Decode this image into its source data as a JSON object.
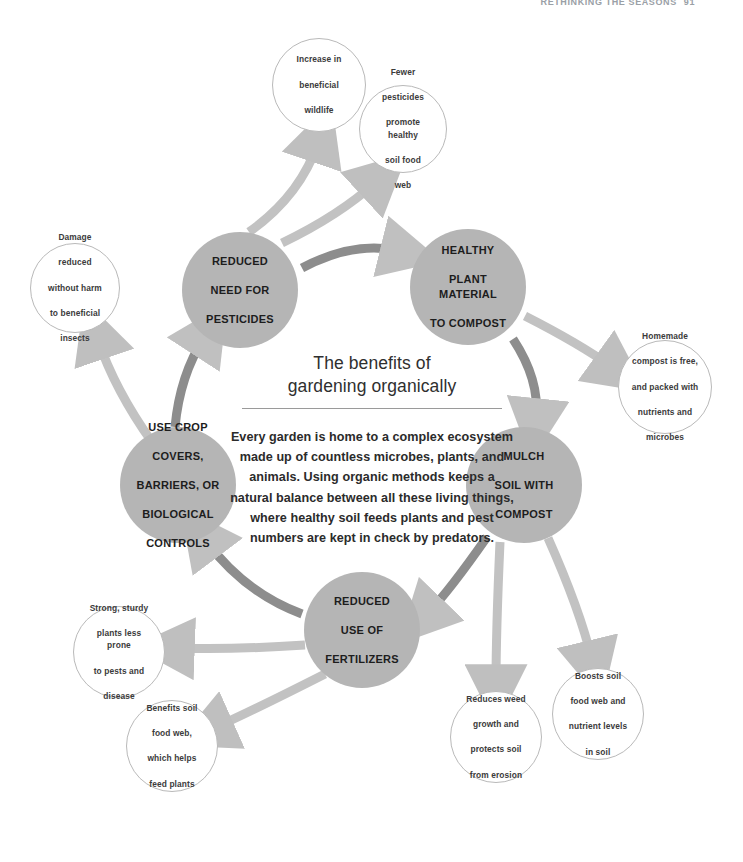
{
  "page_header": {
    "title": "Rethinking the seasons",
    "page_number": "91"
  },
  "center": {
    "title_line1": "The benefits of",
    "title_line2": "gardening organically",
    "body": "Every garden is home to a complex ecosystem made up of countless microbes, plants, and animals. Using organic methods keeps a natural balance between all these living things, where healthy soil feeds plants and pest numbers are kept in check by predators."
  },
  "colors": {
    "hub_fill": "#b5b5b5",
    "satellite_fill": "#ffffff",
    "satellite_stroke": "#b9b9b9",
    "cycle_arrow": "#8d8d8d",
    "spoke_arrow": "#c2c2c2",
    "text_dark": "#1d1d1d",
    "page_header": "#9aa0a6"
  },
  "hubs": [
    {
      "id": "reduced-need-for-pesticides",
      "label": "REDUCED NEED FOR PESTICIDES",
      "lines": [
        "REDUCED",
        "NEED FOR",
        "PESTICIDES"
      ],
      "cx": 240,
      "cy": 290,
      "r": 58
    },
    {
      "id": "healthy-plant-material-to-compost",
      "label": "HEALTHY PLANT MATERIAL TO COMPOST",
      "lines": [
        "HEALTHY",
        "PLANT MATERIAL",
        "TO COMPOST"
      ],
      "cx": 468,
      "cy": 287,
      "r": 58
    },
    {
      "id": "mulch-soil-with-compost",
      "label": "MULCH SOIL WITH COMPOST",
      "lines": [
        "MULCH",
        "SOIL WITH",
        "COMPOST"
      ],
      "cx": 524,
      "cy": 485,
      "r": 58
    },
    {
      "id": "reduced-use-of-fertilizers",
      "label": "REDUCED USE OF FERTILIZERS",
      "lines": [
        "REDUCED",
        "USE OF",
        "FERTILIZERS"
      ],
      "cx": 362,
      "cy": 630,
      "r": 58
    },
    {
      "id": "use-crop-covers-barriers-or-biological-controls",
      "label": "USE CROP COVERS, BARRIERS, OR BIOLOGICAL CONTROLS",
      "lines": [
        "USE CROP",
        "COVERS,",
        "BARRIERS, OR",
        "BIOLOGICAL",
        "CONTROLS"
      ],
      "cx": 178,
      "cy": 485,
      "r": 58
    }
  ],
  "satellites": [
    {
      "id": "increase-in-beneficial-wildlife",
      "label": "Increase in beneficial wildlife",
      "lines": [
        "Increase in",
        "beneficial",
        "wildlife"
      ],
      "cx": 319,
      "cy": 85,
      "r": 47,
      "from_hub": "reduced-need-for-pesticides"
    },
    {
      "id": "fewer-pesticides-promote-healthy-soil-food-web",
      "label": "Fewer pesticides promote healthy soil food web",
      "lines": [
        "Fewer",
        "pesticides",
        "promote healthy",
        "soil food",
        "web"
      ],
      "cx": 403,
      "cy": 129,
      "r": 44,
      "from_hub": "reduced-need-for-pesticides"
    },
    {
      "id": "damage-reduced-without-harm-to-beneficial-insects",
      "label": "Damage reduced without harm to beneficial insects",
      "lines": [
        "Damage",
        "reduced",
        "without harm",
        "to beneficial",
        "insects"
      ],
      "cx": 75,
      "cy": 288,
      "r": 45,
      "from_hub": "use-crop-covers-barriers-or-biological-controls"
    },
    {
      "id": "homemade-compost-is-free",
      "label": "Homemade compost is free, and packed with nutrients and microbes",
      "lines": [
        "Homemade",
        "compost is free,",
        "and packed with",
        "nutrients and",
        "microbes"
      ],
      "cx": 665,
      "cy": 387,
      "r": 47,
      "from_hub": "healthy-plant-material-to-compost"
    },
    {
      "id": "boosts-soil-food-web-and-nutrient-levels-in-soil",
      "label": "Boosts soil food web and nutrient levels in soil",
      "lines": [
        "Boosts soil",
        "food web and",
        "nutrient levels",
        "in soil"
      ],
      "cx": 598,
      "cy": 714,
      "r": 46,
      "from_hub": "mulch-soil-with-compost"
    },
    {
      "id": "reduces-weed-growth-and-protects-soil-from-erosion",
      "label": "Reduces weed growth and protects soil from erosion",
      "lines": [
        "Reduces weed",
        "growth and",
        "protects soil",
        "from erosion"
      ],
      "cx": 496,
      "cy": 737,
      "r": 46,
      "from_hub": "mulch-soil-with-compost"
    },
    {
      "id": "benefits-soil-food-web-which-helps-feed-plants",
      "label": "Benefits soil food web, which helps feed plants",
      "lines": [
        "Benefits soil",
        "food web,",
        "which helps",
        "feed plants"
      ],
      "cx": 172,
      "cy": 746,
      "r": 46,
      "from_hub": "reduced-use-of-fertilizers"
    },
    {
      "id": "strong-sturdy-plants-less-prone-to-pests-and-disease",
      "label": "Strong, sturdy plants less prone to pests and disease",
      "lines": [
        "Strong, sturdy",
        "plants less prone",
        "to pests and",
        "disease"
      ],
      "cx": 119,
      "cy": 652,
      "r": 46,
      "from_hub": "reduced-use-of-fertilizers"
    }
  ],
  "cycle_arrows": [
    {
      "id": "arrow-pesticides-to-compost",
      "from": "reduced-need-for-pesticides",
      "to": "healthy-plant-material-to-compost"
    },
    {
      "id": "arrow-compost-to-mulch",
      "from": "healthy-plant-material-to-compost",
      "to": "mulch-soil-with-compost"
    },
    {
      "id": "arrow-mulch-to-fertilizers",
      "from": "mulch-soil-with-compost",
      "to": "reduced-use-of-fertilizers"
    },
    {
      "id": "arrow-fertilizers-to-crop-covers",
      "from": "reduced-use-of-fertilizers",
      "to": "use-crop-covers-barriers-or-biological-controls"
    },
    {
      "id": "arrow-crop-covers-to-pesticides",
      "from": "use-crop-covers-barriers-or-biological-controls",
      "to": "reduced-need-for-pesticides"
    }
  ]
}
